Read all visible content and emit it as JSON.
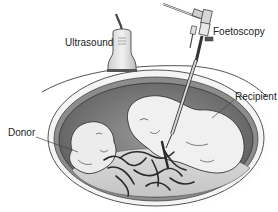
{
  "diagram": {
    "type": "medical-illustration",
    "labels": {
      "ultrasound": "Ultrasound",
      "foetoscopy": "Foetoscopy",
      "recipient": "Recipient",
      "donor": "Donor"
    },
    "colors": {
      "background": "#ffffff",
      "uterus_wall": "#8a8a8a",
      "amniotic_dark": "#7a7a7a",
      "amniotic_light": "#d8d8d8",
      "fetus_fill": "#efefef",
      "outline": "#333333",
      "vessels": "#2a2a2a",
      "text": "#222222"
    }
  }
}
